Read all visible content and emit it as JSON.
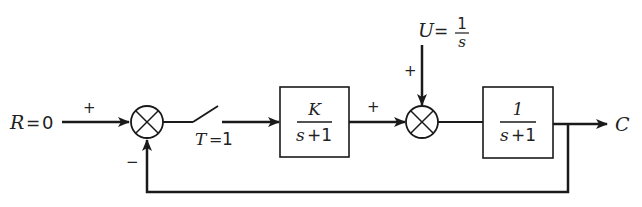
{
  "diagram": {
    "type": "block-diagram",
    "input": {
      "symbol": "R",
      "equals": "=",
      "value": "0",
      "sign": "+"
    },
    "summing_junction_1": {
      "inputs": [
        "+",
        "−"
      ]
    },
    "sampler": {
      "symbol": "T",
      "equals": "=",
      "value": "1"
    },
    "block_1": {
      "numerator": "K",
      "denominator_var": "s",
      "denominator_rest": "+1"
    },
    "block_1_out_sign": "+",
    "disturbance": {
      "symbol": "U",
      "equals": "=",
      "numerator": "1",
      "denominator": "s",
      "sign": "+"
    },
    "summing_junction_2": {
      "inputs": [
        "+",
        "+"
      ]
    },
    "block_2": {
      "numerator": "1",
      "denominator_var": "s",
      "denominator_rest": "+1"
    },
    "output": {
      "symbol": "C"
    },
    "feedback_sign": "−",
    "colors": {
      "line": "#1a1a1a",
      "background": "#ffffff"
    }
  }
}
